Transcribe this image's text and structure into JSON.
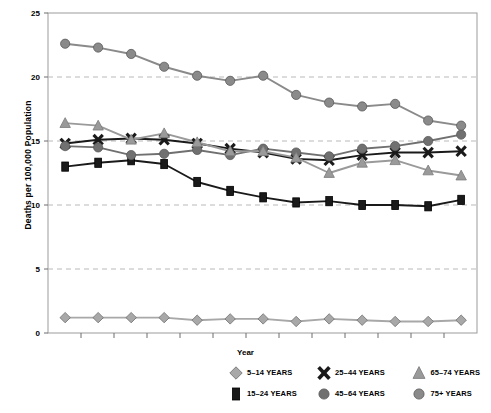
{
  "chart_data": {
    "type": "line",
    "title": "",
    "xlabel": "Year",
    "ylabel": "Deaths per 100,000 Population",
    "ylim": [
      0,
      25
    ],
    "yticks": [
      0,
      5,
      10,
      15,
      20,
      25
    ],
    "grid": "horizontal-dashed",
    "legend_position": "bottom-right",
    "categories": [
      "1992",
      "1993",
      "1994",
      "1995",
      "1996",
      "1997",
      "1998",
      "1999",
      "2000",
      "2001",
      "2002",
      "2003",
      "2004"
    ],
    "series": [
      {
        "name": "5–14 YEARS",
        "marker": "diamond",
        "color": "#a8a8a8",
        "values": [
          1.2,
          1.2,
          1.2,
          1.2,
          1.0,
          1.1,
          1.1,
          0.9,
          1.1,
          1.0,
          0.9,
          0.9,
          1.0
        ]
      },
      {
        "name": "15–24 YEARS",
        "marker": "square",
        "color": "#1a1a1a",
        "values": [
          13.0,
          13.3,
          13.5,
          13.2,
          11.8,
          11.1,
          10.6,
          10.2,
          10.3,
          10.0,
          10.0,
          9.9,
          10.4
        ]
      },
      {
        "name": "25–44 YEARS",
        "marker": "x",
        "color": "#1a1a1a",
        "values": [
          14.8,
          15.1,
          15.2,
          15.1,
          14.8,
          14.4,
          14.1,
          13.6,
          13.5,
          13.9,
          14.1,
          14.1,
          14.2
        ]
      },
      {
        "name": "45–64 YEARS",
        "marker": "circle",
        "color": "#707070",
        "values": [
          14.6,
          14.5,
          13.9,
          14.0,
          14.3,
          13.9,
          14.4,
          14.1,
          13.8,
          14.4,
          14.6,
          15.0,
          15.5
        ]
      },
      {
        "name": "65–74 YEARS",
        "marker": "triangle",
        "color": "#9a9a9a",
        "values": [
          16.4,
          16.2,
          15.1,
          15.6,
          14.9,
          14.2,
          14.2,
          13.7,
          12.5,
          13.3,
          13.5,
          12.7,
          12.3
        ]
      },
      {
        "name": "75+ YEARS",
        "marker": "circle",
        "color": "#8a8a8a",
        "values": [
          22.6,
          22.3,
          21.8,
          20.8,
          20.1,
          19.7,
          20.1,
          18.6,
          18.0,
          17.7,
          17.9,
          16.6,
          16.2
        ]
      }
    ]
  },
  "legend": {
    "rows": [
      [
        {
          "label": "5–14 YEARS",
          "marker": "diamond",
          "color": "#a8a8a8"
        },
        {
          "label": "25–44 YEARS",
          "marker": "x",
          "color": "#1a1a1a"
        },
        {
          "label": "65–74 YEARS",
          "marker": "triangle",
          "color": "#9a9a9a"
        }
      ],
      [
        {
          "label": "15–24 YEARS",
          "marker": "square",
          "color": "#1a1a1a"
        },
        {
          "label": "45–64 YEARS",
          "marker": "circle",
          "color": "#707070"
        },
        {
          "label": "75+ YEARS",
          "marker": "circle",
          "color": "#8a8a8a"
        }
      ]
    ]
  },
  "axes": {
    "y_title": "Deaths per 100,000 Population",
    "x_title": "Year"
  }
}
